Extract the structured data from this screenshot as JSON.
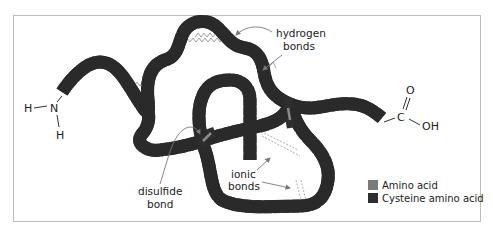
{
  "diagram": {
    "type": "protein tertiary structure",
    "n_terminus": {
      "atom": "N",
      "h1": "H",
      "h2": "H"
    },
    "c_terminus": {
      "carbon": "C",
      "oxygen": "O",
      "hydroxyl": "OH"
    },
    "labels": {
      "hydrogen_line1": "hydrogen",
      "hydrogen_line2": "bonds",
      "disulfide_line1": "disulfide",
      "disulfide_line2": "bond",
      "ionic_line1": "ionic",
      "ionic_line2": "bonds"
    },
    "legend": [
      {
        "label": "Amino acid",
        "color": "#7a7a7a"
      },
      {
        "label": "Cysteine amino acid",
        "color": "#2e2e2e"
      }
    ],
    "colors": {
      "chain_fill": "#7a7a7a",
      "chain_outline": "#2a2a2a",
      "cysteine": "#2e2e2e",
      "hbond": "#9a9a9a",
      "arrow": "#777777",
      "frame": "#bdbdbd"
    }
  }
}
